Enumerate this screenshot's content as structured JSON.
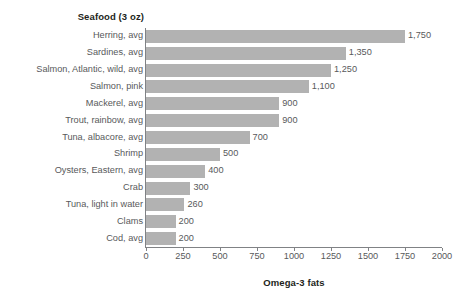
{
  "chart_data": {
    "type": "bar",
    "orientation": "horizontal",
    "title": "",
    "series_axis_title": "Seafood (3 oz)",
    "value_axis_title": "Omega-3 fats",
    "xlabel": "Omega-3 fats",
    "ylabel": "Seafood (3 oz)",
    "xlim": [
      0,
      2000
    ],
    "xticks": [
      0,
      250,
      500,
      750,
      1000,
      1250,
      1500,
      1750,
      2000
    ],
    "xtick_labels": [
      "0",
      "250",
      "500",
      "750",
      "1000",
      "1250",
      "1500",
      "1750",
      "2000"
    ],
    "grid": false,
    "legend": null,
    "bar_color": "#b2b2b2",
    "axis_color": "#808285",
    "text_color": "#58595b",
    "categories": [
      "Herring, avg",
      "Sardines, avg",
      "Salmon, Atlantic, wild, avg",
      "Salmon, pink",
      "Mackerel, avg",
      "Trout, rainbow, avg",
      "Tuna, albacore, avg",
      "Shrimp",
      "Oysters, Eastern, avg",
      "Crab",
      "Tuna, light in water",
      "Clams",
      "Cod, avg"
    ],
    "values": [
      1750,
      1350,
      1250,
      1100,
      900,
      900,
      700,
      500,
      400,
      300,
      260,
      200,
      200
    ],
    "value_labels": [
      "1,750",
      "1,350",
      "1,250",
      "1,100",
      "900",
      "900",
      "700",
      "500",
      "400",
      "300",
      "260",
      "200",
      "200"
    ]
  }
}
